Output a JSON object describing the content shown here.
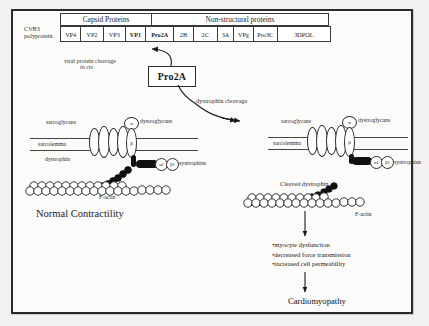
{
  "genome": {
    "organism_label_line1": "CVB3",
    "organism_label_line2": "polyprotein",
    "headers": [
      {
        "label": "Capsid Proteins",
        "span": 4
      },
      {
        "label": "Non-structural proteins",
        "span": 8
      }
    ],
    "cells": [
      {
        "label": "VP4",
        "width": 22,
        "bold": false
      },
      {
        "label": "VP2",
        "width": 24,
        "bold": false
      },
      {
        "label": "VP3",
        "width": 24,
        "bold": false
      },
      {
        "label": "VP1",
        "width": 22,
        "bold": true
      },
      {
        "label": "Pro2A",
        "width": 30,
        "bold": true
      },
      {
        "label": "2B",
        "width": 21,
        "bold": false
      },
      {
        "label": "2C",
        "width": 26,
        "bold": false
      },
      {
        "label": "3A",
        "width": 18,
        "bold": false
      },
      {
        "label": "VPg",
        "width": 21,
        "bold": false
      },
      {
        "label": "Pro3C",
        "width": 26,
        "bold": false
      },
      {
        "label": "3DPOL",
        "width": 56,
        "bold": false
      }
    ]
  },
  "protease": {
    "box_label": "Pro2A",
    "cis_cleavage_line1": "viral protein cleavage",
    "cis_cleavage_line2": "in cis",
    "dystrophin_cleavage_label": "dystrophin cleavage"
  },
  "left_panel": {
    "caption": "Normal Contractility",
    "labels": {
      "sarcoglycans": "sarcoglycans",
      "dystroglycans": "dystroglycans",
      "sarcolemma": "sarcolemma",
      "dystrophin": "dystrophin",
      "syntrophins": "syntrophins",
      "f_actin": "F-actin"
    },
    "subunits": {
      "alpha": "α",
      "beta": "β",
      "syn1": "α1",
      "syn2": "β1"
    }
  },
  "right_panel": {
    "labels": {
      "sarcoglycans": "sarcoglycans",
      "dystroglycans": "dystroglycans",
      "sarcolemma": "sarcolemma",
      "syntrophins": "syntrophins",
      "cleaved_dystrophin": "Cleaved dystrophin",
      "f_actin": "F-actin"
    },
    "subunits": {
      "alpha": "α",
      "beta": "β",
      "syn1": "α1",
      "syn2": "β1"
    }
  },
  "outcomes": {
    "bullets": [
      "•myocyte dysfunction",
      "•decreased force transmission",
      "•increased cell permeability"
    ],
    "result": "Cardiomyopathy"
  },
  "colors": {
    "frame": "#2a2a2a",
    "background": "#fbfbfa",
    "ink": "#1a1a1a",
    "rod_fill": "#111111"
  }
}
